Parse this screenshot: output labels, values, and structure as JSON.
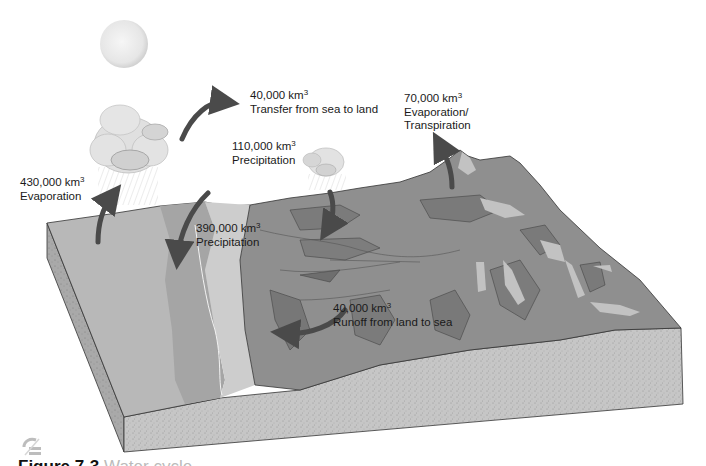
{
  "figure": {
    "type": "hydrologic-cycle-block-diagram",
    "caption_visible": "Figure 7-3",
    "caption_rest": "  Water cycle"
  },
  "labels": {
    "evaporation_ocean": {
      "value": "430,000 km",
      "exp": "3",
      "desc": "Evaporation"
    },
    "transfer": {
      "value": "40,000 km",
      "exp": "3",
      "desc": "Transfer from sea to land"
    },
    "precip_land": {
      "value": "110,000 km",
      "exp": "3",
      "desc": "Precipitation"
    },
    "evapotranspiration": {
      "value": "70,000 km",
      "exp": "3",
      "desc1": "Evaporation/",
      "desc2": "Transpiration"
    },
    "precip_ocean": {
      "value": "390,000 km",
      "exp": "3",
      "desc": "Precipitation"
    },
    "runoff": {
      "value": "40,000 km",
      "exp": "3",
      "desc": "Runoff from land to sea"
    }
  },
  "colors": {
    "ocean_far": "#b9b9b9",
    "ocean_mid": "#a6a6a6",
    "shore": "#cfcfcf",
    "land": "#8e8e8e",
    "land_dark": "#7a7a7a",
    "land_light": "#c4c4c4",
    "soil": "#c8c8c8",
    "arrow": "#4a4a4a",
    "cloud": "#dcdcdc"
  }
}
